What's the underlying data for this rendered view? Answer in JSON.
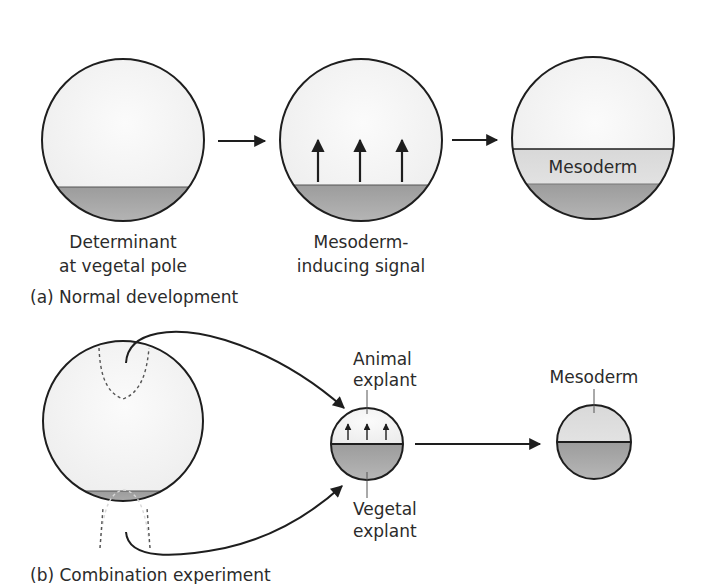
{
  "panel_a": {
    "caption": "(a)  Normal development",
    "stage1": {
      "label_line1": "Determinant",
      "label_line2": "at vegetal pole"
    },
    "stage2": {
      "label_line1": "Mesoderm-",
      "label_line2": "inducing signal"
    },
    "stage3": {
      "inner_label": "Mesoderm"
    }
  },
  "panel_b": {
    "caption": "(b)  Combination experiment",
    "explant": {
      "animal_label_line1": "Animal",
      "animal_label_line2": "explant",
      "vegetal_label_line1": "Vegetal",
      "vegetal_label_line2": "explant"
    },
    "result": {
      "label": "Mesoderm"
    }
  },
  "colors": {
    "outline": "#1e1e1e",
    "animal_fill": "#f6f6f6",
    "mesoderm_fill": "#dcdcdc",
    "vegetal_fill": "#a9a9a9",
    "text": "#2b2b2b"
  }
}
